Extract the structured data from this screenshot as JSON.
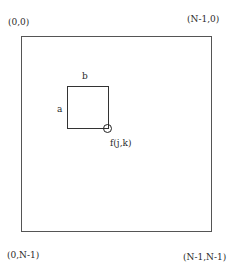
{
  "diagram": {
    "corners": {
      "top_left": "(0,0)",
      "top_right": "(N-1,0)",
      "bottom_left": "(0,N-1)",
      "bottom_right": "(N-1,N-1)"
    },
    "window": {
      "width_label": "b",
      "height_label": "a"
    },
    "pixel_marker": {
      "label": "f(j,k)"
    }
  }
}
